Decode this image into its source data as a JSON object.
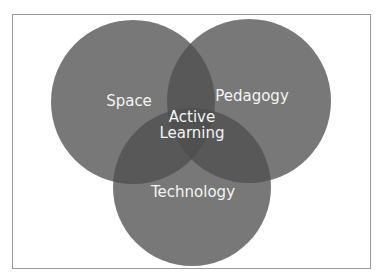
{
  "diagram": {
    "type": "venn",
    "sets": [
      {
        "id": "space",
        "label": "Space"
      },
      {
        "id": "pedagogy",
        "label": "Pedagogy"
      },
      {
        "id": "technology",
        "label": "Technology"
      }
    ],
    "center": {
      "line1": "Active",
      "line2": "Learning"
    }
  },
  "colors": {
    "frame_border": "#9a9a9a",
    "circle_fill": "#5a5a5a",
    "label_text": "#f4f4f4",
    "background": "#ffffff"
  }
}
